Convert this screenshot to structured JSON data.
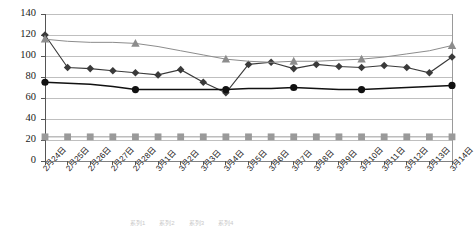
{
  "chart_data": {
    "type": "line",
    "title": "",
    "xlabel": "",
    "ylabel": "",
    "ylim": [
      0,
      140
    ],
    "yticks": [
      0,
      20,
      40,
      60,
      80,
      100,
      120,
      140
    ],
    "grid": true,
    "legend_position": "bottom",
    "categories": [
      "2月24日",
      "2月25日",
      "2月26日",
      "2月27日",
      "2月28日",
      "3月1日",
      "3月2日",
      "3月3日",
      "3月4日",
      "3月5日",
      "3月6日",
      "3月7日",
      "3月8日",
      "3月9日",
      "3月10日",
      "3月11日",
      "3月12日",
      "3月13日",
      "3月14日"
    ],
    "series": [
      {
        "name": "series-diamond",
        "marker": "diamond",
        "color": "#3a3a3a",
        "values": [
          120,
          89,
          88,
          86,
          84,
          82,
          87,
          75,
          65,
          92,
          94,
          88,
          92,
          90,
          89,
          91,
          89,
          84,
          99
        ]
      },
      {
        "name": "series-triangle",
        "marker": "triangle",
        "color": "#8c8c8c",
        "marker_indices": [
          0,
          4,
          8,
          11,
          14,
          18
        ],
        "values": [
          116,
          114,
          113,
          113,
          112,
          109,
          105,
          101,
          97,
          95,
          94,
          95,
          95,
          96,
          97,
          99,
          102,
          105,
          110
        ]
      },
      {
        "name": "series-circle",
        "marker": "circle",
        "color": "#111111",
        "marker_indices": [
          0,
          4,
          8,
          11,
          14,
          18
        ],
        "values": [
          75,
          74,
          73,
          71,
          68,
          68,
          68,
          68,
          68,
          69,
          69,
          70,
          69,
          68,
          68,
          69,
          70,
          71,
          72
        ]
      },
      {
        "name": "series-square",
        "marker": "square",
        "color": "#9a9a9a",
        "values": [
          23,
          23,
          23,
          23,
          23,
          23,
          23,
          23,
          23,
          23,
          23,
          23,
          23,
          23,
          23,
          23,
          23,
          23,
          23
        ]
      }
    ]
  },
  "axis": {
    "y_tick_labels": [
      "140",
      "120",
      "100",
      "80",
      "60",
      "40",
      "20",
      "0"
    ]
  },
  "legend": {
    "entries": [
      "系列1",
      "系列2",
      "系列3",
      "系列4"
    ]
  }
}
